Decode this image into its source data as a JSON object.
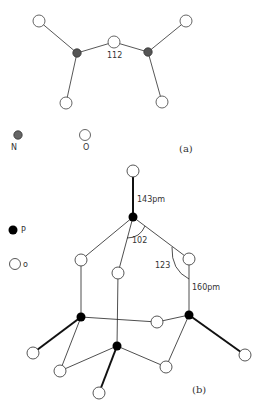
{
  "panel_a": {
    "angle_label": "112",
    "legend": {
      "n_label": "N",
      "o_label": "O"
    },
    "caption": "(a)",
    "colors": {
      "nitrogen": "#555555",
      "oxygen": "#ffffff",
      "bond": "#444444"
    }
  },
  "panel_b": {
    "bond_length_terminal": "143pm",
    "bond_length_bridge": "160pm",
    "angle_opo": "102",
    "angle_pop": "123",
    "legend": {
      "p_label": "P",
      "o_label": "o"
    },
    "caption": "(b)",
    "colors": {
      "phosphorus": "#000000",
      "oxygen": "#ffffff",
      "bond": "#222222"
    }
  }
}
